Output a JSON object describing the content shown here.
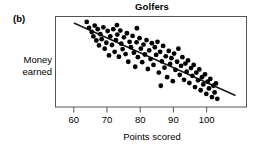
{
  "figure": {
    "panel_label": "(b)",
    "title": "Golfers",
    "ylabel_line1": "Money",
    "ylabel_line2": "earned",
    "xlabel": "Points scored"
  },
  "chart_data": {
    "type": "scatter",
    "title": "Golfers",
    "panel": "(b)",
    "xlabel": "Points scored",
    "ylabel": "Money earned",
    "xlim": [
      54.5,
      112
    ],
    "ylim": [
      0,
      100
    ],
    "xticks": [
      60,
      70,
      80,
      90,
      100
    ],
    "xtick_labels": [
      "60",
      "70",
      "80",
      "90",
      "100"
    ],
    "yticks": [],
    "ytick_labels": [],
    "grid": false,
    "legend": false,
    "axis_frame": "box",
    "marker": "filled-circle",
    "marker_color": "#000000",
    "marker_radius_px": 2.4,
    "relationship": "negative linear association",
    "trend_line": {
      "visible": true,
      "color": "#1a1a1a",
      "width_px": 1.6,
      "x_start": 60.2,
      "y_start": 92.5,
      "x_end": 108.5,
      "y_end": 13.0
    },
    "n_points": 96,
    "points": [
      [
        63.9,
        94.0
      ],
      [
        64.6,
        87.5
      ],
      [
        65.4,
        83.0
      ],
      [
        65.9,
        78.0
      ],
      [
        66.3,
        90.0
      ],
      [
        66.8,
        73.5
      ],
      [
        67.2,
        86.0
      ],
      [
        67.6,
        68.0
      ],
      [
        68.0,
        80.5
      ],
      [
        68.4,
        75.0
      ],
      [
        68.9,
        88.0
      ],
      [
        69.3,
        64.5
      ],
      [
        69.8,
        71.0
      ],
      [
        70.2,
        84.0
      ],
      [
        70.6,
        57.0
      ],
      [
        71.0,
        78.0
      ],
      [
        71.5,
        68.5
      ],
      [
        71.9,
        86.0
      ],
      [
        72.3,
        61.0
      ],
      [
        72.7,
        74.0
      ],
      [
        73.1,
        80.0
      ],
      [
        73.6,
        55.5
      ],
      [
        74.0,
        84.5
      ],
      [
        74.3,
        70.0
      ],
      [
        74.7,
        64.0
      ],
      [
        75.1,
        77.0
      ],
      [
        75.6,
        58.5
      ],
      [
        76.0,
        81.5
      ],
      [
        76.4,
        50.0
      ],
      [
        76.8,
        72.0
      ],
      [
        77.2,
        66.0
      ],
      [
        77.7,
        78.5
      ],
      [
        78.1,
        60.0
      ],
      [
        78.5,
        44.5
      ],
      [
        78.9,
        71.5
      ],
      [
        79.3,
        55.0
      ],
      [
        79.8,
        76.0
      ],
      [
        80.2,
        64.5
      ],
      [
        80.6,
        49.5
      ],
      [
        81.0,
        69.0
      ],
      [
        81.4,
        58.0
      ],
      [
        81.9,
        74.0
      ],
      [
        82.3,
        42.0
      ],
      [
        82.7,
        62.5
      ],
      [
        83.1,
        53.0
      ],
      [
        83.5,
        70.5
      ],
      [
        84.0,
        46.5
      ],
      [
        84.4,
        66.0
      ],
      [
        84.8,
        57.5
      ],
      [
        85.2,
        72.0
      ],
      [
        85.6,
        38.0
      ],
      [
        86.0,
        61.0
      ],
      [
        86.5,
        50.5
      ],
      [
        86.9,
        67.5
      ],
      [
        87.3,
        43.5
      ],
      [
        87.7,
        56.0
      ],
      [
        88.1,
        33.0
      ],
      [
        88.6,
        62.0
      ],
      [
        89.0,
        47.5
      ],
      [
        89.4,
        54.0
      ],
      [
        89.8,
        28.5
      ],
      [
        90.2,
        59.0
      ],
      [
        90.6,
        41.0
      ],
      [
        91.1,
        50.0
      ],
      [
        91.5,
        64.5
      ],
      [
        91.9,
        35.5
      ],
      [
        92.3,
        45.5
      ],
      [
        92.7,
        55.0
      ],
      [
        93.2,
        30.0
      ],
      [
        93.6,
        48.0
      ],
      [
        94.0,
        39.0
      ],
      [
        94.4,
        51.5
      ],
      [
        94.8,
        26.5
      ],
      [
        95.3,
        43.0
      ],
      [
        95.7,
        34.5
      ],
      [
        96.1,
        46.5
      ],
      [
        96.5,
        22.0
      ],
      [
        96.9,
        38.0
      ],
      [
        97.4,
        29.5
      ],
      [
        97.8,
        41.5
      ],
      [
        98.2,
        18.5
      ],
      [
        98.6,
        33.0
      ],
      [
        99.0,
        25.0
      ],
      [
        99.5,
        36.0
      ],
      [
        99.9,
        14.5
      ],
      [
        100.3,
        28.0
      ],
      [
        100.7,
        20.5
      ],
      [
        101.1,
        31.0
      ],
      [
        101.6,
        11.0
      ],
      [
        102.0,
        23.5
      ],
      [
        102.4,
        16.0
      ],
      [
        102.8,
        26.0
      ],
      [
        103.2,
        9.0
      ],
      [
        86.2,
        23.5
      ],
      [
        79.0,
        87.0
      ],
      [
        73.0,
        90.5
      ]
    ]
  }
}
